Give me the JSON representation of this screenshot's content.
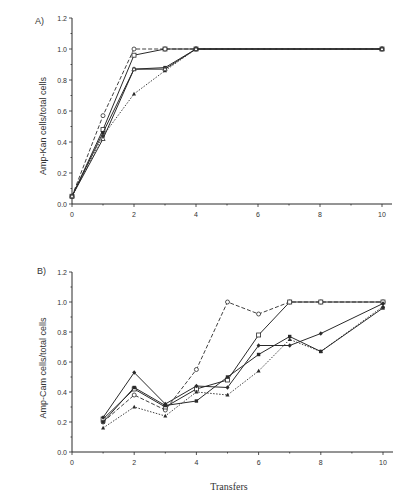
{
  "chart_data": [
    {
      "type": "line",
      "panel_label": "A)",
      "title": "",
      "xlabel": "",
      "ylabel": "Amp-Kan cells/total cells",
      "xlim": [
        0,
        10.5
      ],
      "ylim": [
        0,
        1.2
      ],
      "xticks": [
        0,
        2,
        4,
        6,
        8,
        10
      ],
      "xtick_labels": [
        "0",
        "2",
        "4",
        "6",
        "8",
        "10"
      ],
      "yticks": [
        0.0,
        0.2,
        0.4,
        0.6,
        0.8,
        1.0,
        1.2
      ],
      "ytick_labels": [
        "0.0",
        "0.2",
        "0.4",
        "0.6",
        "0.8",
        "1.0",
        "1.2"
      ],
      "grid": false,
      "legend": "none",
      "series": [
        {
          "name": "open-square",
          "marker": "open-square",
          "line": "solid",
          "x": [
            0,
            1,
            2,
            3,
            4,
            10
          ],
          "values": [
            0.05,
            0.48,
            0.96,
            1.0,
            1.0,
            1.0
          ]
        },
        {
          "name": "open-circle",
          "marker": "open-circle",
          "line": "dashed",
          "x": [
            0,
            1,
            2,
            3,
            4,
            10
          ],
          "values": [
            0.05,
            0.57,
            1.0,
            1.0,
            1.0,
            1.0
          ]
        },
        {
          "name": "filled-square",
          "marker": "filled-square",
          "line": "solid",
          "x": [
            0,
            1,
            2,
            3,
            4,
            10
          ],
          "values": [
            0.05,
            0.46,
            0.87,
            0.88,
            1.0,
            1.0
          ]
        },
        {
          "name": "filled-triangle",
          "marker": "filled-triangle",
          "line": "dotted",
          "x": [
            0,
            1,
            2,
            3,
            4,
            10
          ],
          "values": [
            0.05,
            0.44,
            0.71,
            0.86,
            1.0,
            1.0
          ]
        },
        {
          "name": "open-triangle",
          "marker": "open-triangle",
          "line": "solid",
          "x": [
            0,
            1,
            2,
            3,
            4,
            10
          ],
          "values": [
            0.05,
            0.42,
            0.87,
            0.87,
            1.0,
            1.0
          ]
        }
      ]
    },
    {
      "type": "line",
      "panel_label": "B)",
      "title": "",
      "xlabel": "Transfers",
      "ylabel": "Amp-Cam cells/total cells",
      "xlim": [
        0,
        10.5
      ],
      "ylim": [
        0,
        1.2
      ],
      "xticks": [
        0,
        2,
        4,
        6,
        8,
        10
      ],
      "xtick_labels": [
        "0",
        "2",
        "4",
        "6",
        "8",
        "10"
      ],
      "yticks": [
        0.0,
        0.2,
        0.4,
        0.6,
        0.8,
        1.0,
        1.2
      ],
      "ytick_labels": [
        "0.0",
        "0.2",
        "0.4",
        "0.6",
        "0.8",
        "1.0",
        "1.2"
      ],
      "grid": false,
      "legend": "none",
      "series": [
        {
          "name": "open-circle",
          "marker": "open-circle",
          "line": "dashed",
          "x": [
            1,
            2,
            3,
            4,
            5,
            6,
            7,
            8,
            10
          ],
          "values": [
            0.2,
            0.38,
            0.28,
            0.55,
            1.0,
            0.92,
            1.0,
            1.0,
            1.0
          ]
        },
        {
          "name": "open-square",
          "marker": "open-square",
          "line": "solid",
          "x": [
            1,
            2,
            3,
            4,
            5,
            6,
            7,
            8,
            10
          ],
          "values": [
            0.22,
            0.42,
            0.3,
            0.42,
            0.48,
            0.78,
            1.0,
            1.0,
            1.0
          ]
        },
        {
          "name": "filled-diamond",
          "marker": "filled-diamond",
          "line": "solid",
          "x": [
            1,
            2,
            3,
            4,
            5,
            6,
            7,
            8,
            10
          ],
          "values": [
            0.23,
            0.53,
            0.32,
            0.44,
            0.43,
            0.71,
            0.71,
            0.79,
            0.99
          ]
        },
        {
          "name": "filled-square",
          "marker": "filled-square",
          "line": "solid",
          "x": [
            1,
            2,
            3,
            4,
            5,
            6,
            7,
            8,
            10
          ],
          "values": [
            0.2,
            0.43,
            0.31,
            0.34,
            0.5,
            0.65,
            0.77,
            0.67,
            0.96
          ]
        },
        {
          "name": "filled-triangle",
          "marker": "filled-triangle",
          "line": "dotted",
          "x": [
            1,
            2,
            3,
            4,
            5,
            6,
            7,
            8,
            10
          ],
          "values": [
            0.16,
            0.3,
            0.24,
            0.4,
            0.38,
            0.54,
            0.75,
            0.67,
            0.97
          ]
        }
      ]
    }
  ],
  "colors": {
    "ink": "#2a2a2a",
    "background": "#ffffff"
  }
}
